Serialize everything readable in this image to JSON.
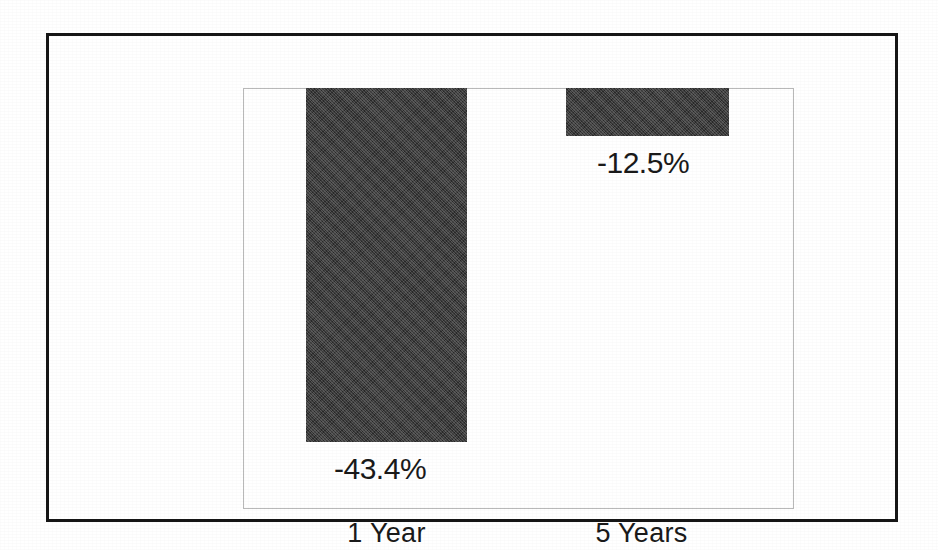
{
  "document": {
    "kind": "scanned-bar-chart",
    "background_color": "#ffffff",
    "frame_color": "#161616",
    "plot_border_color": "#b9b9b9"
  },
  "chart_data": {
    "type": "bar",
    "title": "",
    "subtitle": "",
    "xlabel": "",
    "ylabel": "",
    "orientation": "vertical",
    "grid": false,
    "legend": false,
    "legend_position": "none",
    "axis_tick_labels": [],
    "ylim": [
      -50,
      0
    ],
    "zero_baseline_position": "top",
    "bar_color": "#3a3a3a",
    "categories": [
      "1 Year",
      "5 Years"
    ],
    "values": [
      -43.4,
      -12.5
    ],
    "value_labels": [
      "-43.4%",
      "-12.5%"
    ],
    "units": "percent",
    "points": [
      {
        "category": "1 Year",
        "value": -43.4,
        "label": "-43.4%"
      },
      {
        "category": "5 Years",
        "value": -12.5,
        "label": "-12.5%"
      }
    ]
  },
  "chart": {
    "bars": [
      {
        "name": "bar-1-year",
        "category": "1 Year",
        "value_label": "-43.4%"
      },
      {
        "name": "bar-5-years",
        "category": "5 Years",
        "value_label": "-12.5%"
      }
    ]
  }
}
